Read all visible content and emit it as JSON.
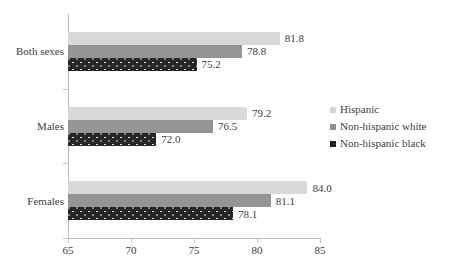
{
  "chart_data": {
    "type": "bar",
    "orientation": "horizontal",
    "title": "",
    "xlabel": "",
    "ylabel": "",
    "categories": [
      "Both sexes",
      "Males",
      "Females"
    ],
    "xlim": [
      65,
      85
    ],
    "xticks": [
      65,
      70,
      75,
      80,
      85
    ],
    "grid": false,
    "legend_position": "right",
    "series": [
      {
        "name": "Hispanic",
        "color": "#d9d9d9",
        "values": [
          81.8,
          79.2,
          84.0
        ],
        "labels": [
          "81.8",
          "79.2",
          "84.0"
        ]
      },
      {
        "name": "Non-hispanic white",
        "color": "#959595",
        "values": [
          78.8,
          76.5,
          81.1
        ],
        "labels": [
          "78.8",
          "76.5",
          "81.1"
        ]
      },
      {
        "name": "Non-hispanic black",
        "color": "#262626",
        "values": [
          75.2,
          72.0,
          78.1
        ],
        "labels": [
          "75.2",
          "72.0",
          "78.1"
        ]
      }
    ]
  },
  "axis": {
    "tick_labels": [
      "65",
      "70",
      "75",
      "80",
      "85"
    ]
  },
  "categories": {
    "c0": "Both sexes",
    "c1": "Males",
    "c2": "Females"
  },
  "legend": {
    "items": [
      {
        "label": "Hispanic"
      },
      {
        "label": "Non-hispanic white"
      },
      {
        "label": "Non-hispanic black"
      }
    ]
  }
}
